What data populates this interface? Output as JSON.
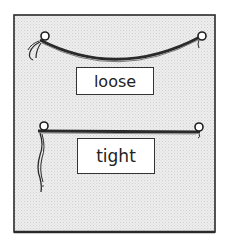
{
  "diagram": {
    "panel": {
      "background": "#e6e6e6",
      "border_color": "#2a2a2a"
    },
    "strings": [
      {
        "state": "loose",
        "label": "loose",
        "shape": "sagging curve"
      },
      {
        "state": "tight",
        "label": "tight",
        "shape": "straight line"
      }
    ]
  }
}
